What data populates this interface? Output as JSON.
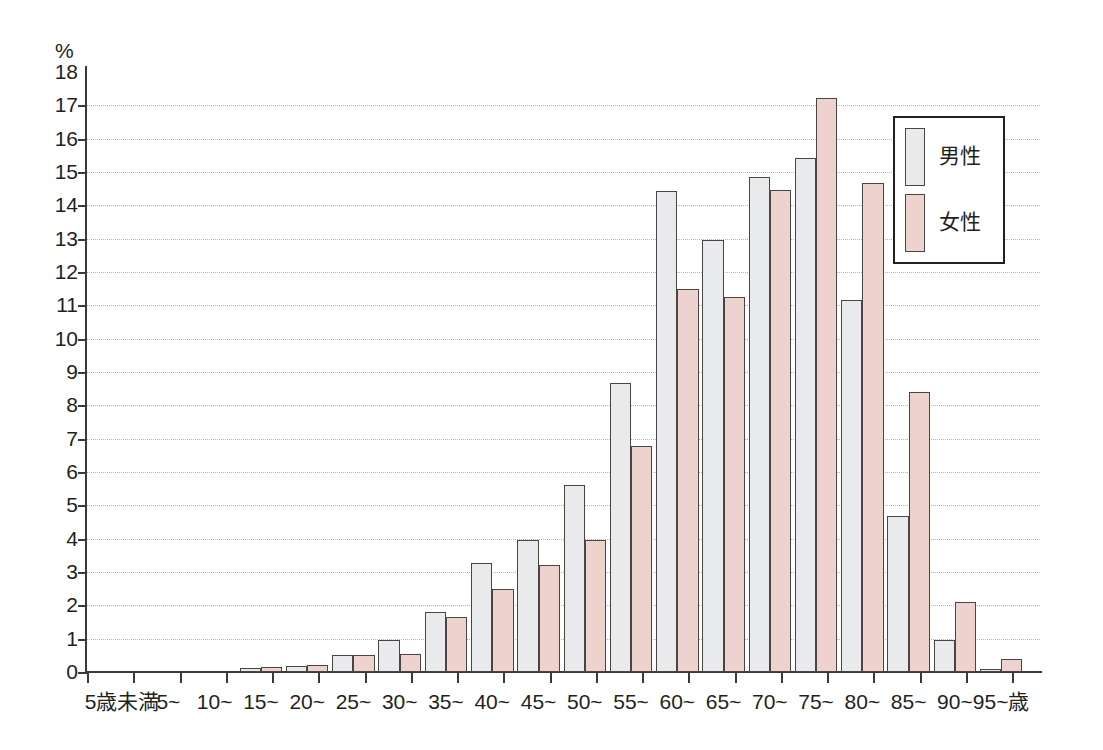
{
  "chart_data": {
    "type": "bar",
    "title": "",
    "subtitle": "",
    "xlabel": "",
    "ylabel": "%",
    "ylim": [
      0,
      18
    ],
    "ytick_step": 1,
    "grid": true,
    "grid_style": "dotted-horizontal",
    "legend_position": "top-right-inside",
    "axis_unit_top_left": "%",
    "x_axis_unit_suffix": "歳",
    "categories": [
      "5歳未満",
      "5~",
      "10~",
      "15~",
      "20~",
      "25~",
      "30~",
      "35~",
      "40~",
      "45~",
      "50~",
      "55~",
      "60~",
      "65~",
      "70~",
      "75~",
      "80~",
      "85~",
      "90~",
      "95~歳"
    ],
    "ytick_labels": [
      "0",
      "1",
      "2",
      "3",
      "4",
      "5",
      "6",
      "7",
      "8",
      "9",
      "10",
      "11",
      "12",
      "13",
      "14",
      "15",
      "16",
      "17",
      "18"
    ],
    "series": [
      {
        "name": "男性",
        "color": "#e9eaec",
        "values": [
          0.0,
          0.0,
          0.0,
          0.12,
          0.18,
          0.52,
          0.97,
          1.8,
          3.28,
          3.96,
          5.62,
          8.68,
          14.42,
          12.96,
          14.84,
          15.42,
          11.15,
          4.68,
          0.95,
          0.1
        ]
      },
      {
        "name": "女性",
        "color": "#eed2cd",
        "values": [
          0.0,
          0.0,
          0.0,
          0.14,
          0.2,
          0.52,
          0.54,
          1.66,
          2.5,
          3.22,
          3.96,
          6.78,
          11.5,
          11.25,
          14.45,
          17.22,
          14.68,
          8.4,
          2.1,
          0.38
        ]
      }
    ]
  },
  "legend": {
    "items": [
      {
        "label": "男性",
        "color": "#e9eaec"
      },
      {
        "label": "女性",
        "color": "#eed2cd"
      }
    ]
  },
  "colors": {
    "male_fill": "#e9eaec",
    "female_fill": "#eed2cd",
    "bar_stroke": "#4a4443",
    "axis": "#3a3a3a",
    "grid": "#b9b2b0",
    "text": "#231f20",
    "background": "#ffffff"
  }
}
